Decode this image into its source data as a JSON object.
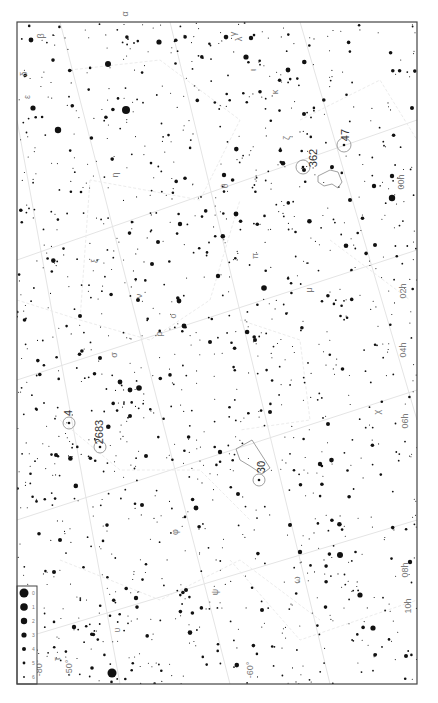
{
  "map": {
    "title": "Star chart — southern sky (LMC / SMC region)",
    "frame": {
      "x": 17,
      "y": 22,
      "w": 400,
      "h": 662
    },
    "ra_labels": [
      {
        "text": "00h",
        "x": 404,
        "y": 182
      },
      {
        "text": "02h",
        "x": 406,
        "y": 291
      },
      {
        "text": "04h",
        "x": 406,
        "y": 350
      },
      {
        "text": "06h",
        "x": 408,
        "y": 421
      },
      {
        "text": "08h",
        "x": 408,
        "y": 570
      },
      {
        "text": "10h",
        "x": 411,
        "y": 606
      }
    ],
    "dec_labels": [
      {
        "text": "-80°",
        "x": 42,
        "y": 668
      },
      {
        "text": "-50°",
        "x": 72,
        "y": 668
      },
      {
        "text": "-60°",
        "x": 253,
        "y": 670
      }
    ],
    "objects": [
      {
        "label": "47",
        "type": "cluster",
        "cx": 344,
        "cy": 145,
        "r": 7,
        "lx": 345,
        "ly": 135
      },
      {
        "label": "362",
        "type": "cluster",
        "cx": 303,
        "cy": 167,
        "r": 7,
        "lx": 313,
        "ly": 158
      },
      {
        "label": "4",
        "type": "cluster",
        "cx": 69,
        "cy": 423,
        "r": 6,
        "lx": 68,
        "ly": 413
      },
      {
        "label": "2683",
        "type": "cluster",
        "cx": 100,
        "cy": 447,
        "r": 6,
        "lx": 99,
        "ly": 432
      },
      {
        "label": "30",
        "type": "cluster",
        "cx": 259,
        "cy": 480,
        "r": 6,
        "lx": 261,
        "ly": 467
      }
    ],
    "nebulae": [
      {
        "name": "SMC",
        "points": "318,176 330,170 338,172 342,182 338,188 332,184 324,186 318,182"
      },
      {
        "name": "LMC",
        "points": "236,449 252,440 270,468 262,474 250,466 240,460"
      }
    ],
    "greek_labels": [
      {
        "text": "α",
        "x": 128,
        "y": 14
      },
      {
        "text": "β",
        "x": 44,
        "y": 36
      },
      {
        "text": "γ",
        "x": 236,
        "y": 34
      },
      {
        "text": "δ",
        "x": 27,
        "y": 74
      },
      {
        "text": "ε",
        "x": 30,
        "y": 97
      },
      {
        "text": "ζ",
        "x": 290,
        "y": 138
      },
      {
        "text": "η",
        "x": 118,
        "y": 175
      },
      {
        "text": "θ",
        "x": 228,
        "y": 186
      },
      {
        "text": "ι",
        "x": 256,
        "y": 70
      },
      {
        "text": "κ",
        "x": 278,
        "y": 92
      },
      {
        "text": "λ",
        "x": 242,
        "y": 39
      },
      {
        "text": "μ",
        "x": 312,
        "y": 290
      },
      {
        "text": "ν",
        "x": 142,
        "y": 296
      },
      {
        "text": "ξ",
        "x": 98,
        "y": 261
      },
      {
        "text": "ο",
        "x": 176,
        "y": 316
      },
      {
        "text": "π",
        "x": 258,
        "y": 256
      },
      {
        "text": "ρ",
        "x": 162,
        "y": 334
      },
      {
        "text": "σ",
        "x": 117,
        "y": 355
      },
      {
        "text": "τ",
        "x": 60,
        "y": 659
      },
      {
        "text": "υ",
        "x": 120,
        "y": 630
      },
      {
        "text": "φ",
        "x": 178,
        "y": 532
      },
      {
        "text": "χ",
        "x": 380,
        "y": 412
      },
      {
        "text": "ψ",
        "x": 218,
        "y": 592
      },
      {
        "text": "ω",
        "x": 300,
        "y": 580
      }
    ],
    "legend": {
      "x": 17,
      "y": 586,
      "w": 20,
      "h": 98,
      "magnitudes": [
        {
          "mag": "0",
          "r": 4.5
        },
        {
          "mag": "1",
          "r": 3.8
        },
        {
          "mag": "2",
          "r": 3.2
        },
        {
          "mag": "3",
          "r": 2.6
        },
        {
          "mag": "4",
          "r": 2.0
        },
        {
          "mag": "5",
          "r": 1.4
        },
        {
          "mag": "6",
          "r": 0.9
        }
      ]
    },
    "bright_stars": [
      [
        126,
        110,
        4.0
      ],
      [
        112,
        673,
        4.5
      ],
      [
        58,
        130,
        3.2
      ],
      [
        108,
        64,
        3.0
      ],
      [
        159,
        42,
        2.6
      ],
      [
        31,
        40,
        2.4
      ],
      [
        33,
        108,
        2.6
      ],
      [
        251,
        38,
        2.2
      ],
      [
        246,
        57,
        2.6
      ],
      [
        288,
        70,
        2.4
      ],
      [
        304,
        170,
        2.0
      ],
      [
        332,
        167,
        2.0
      ],
      [
        392,
        198,
        3.2
      ],
      [
        374,
        186,
        2.2
      ],
      [
        130,
        390,
        2.4
      ],
      [
        139,
        388,
        2.8
      ],
      [
        120,
        382,
        2.4
      ],
      [
        264,
        288,
        2.8
      ],
      [
        179,
        301,
        2.4
      ],
      [
        184,
        326,
        2.4
      ],
      [
        218,
        276,
        2.2
      ],
      [
        340,
        555,
        3.0
      ],
      [
        360,
        595,
        2.6
      ],
      [
        410,
        562,
        2.2
      ],
      [
        373,
        628,
        2.6
      ],
      [
        300,
        552,
        2.2
      ],
      [
        196,
        508,
        2.4
      ],
      [
        74,
        627,
        2.2
      ],
      [
        136,
        598,
        2.2
      ],
      [
        92,
        668,
        1.8
      ],
      [
        320,
        464,
        2.2
      ],
      [
        328,
        424,
        2.0
      ],
      [
        236,
        214,
        2.4
      ],
      [
        224,
        175,
        2.2
      ],
      [
        158,
        242,
        2.0
      ],
      [
        152,
        264,
        2.0
      ],
      [
        180,
        224,
        2.2
      ],
      [
        138,
        300,
        2.0
      ],
      [
        130,
        416,
        2.0
      ],
      [
        146,
        456,
        2.0
      ],
      [
        54,
        572,
        2.0
      ],
      [
        56,
        455,
        2.0
      ],
      [
        304,
        114,
        2.0
      ],
      [
        350,
        200,
        2.0
      ],
      [
        375,
        245,
        2.0
      ],
      [
        412,
        108,
        2.0
      ],
      [
        392,
        176,
        2.2
      ],
      [
        270,
        412,
        2.0
      ],
      [
        255,
        340,
        2.0
      ],
      [
        210,
        342,
        2.0
      ],
      [
        290,
        525,
        2.0
      ],
      [
        186,
        590,
        2.0
      ],
      [
        262,
        610,
        2.0
      ],
      [
        406,
        656,
        2.0
      ],
      [
        220,
        452,
        2.2
      ],
      [
        238,
        494,
        2.0
      ],
      [
        60,
        540,
        2.0
      ],
      [
        80,
        316,
        2.0
      ],
      [
        100,
        358,
        2.0
      ],
      [
        142,
        505,
        2.0
      ]
    ],
    "seed": 20240611,
    "faint_star_count": 1400
  }
}
